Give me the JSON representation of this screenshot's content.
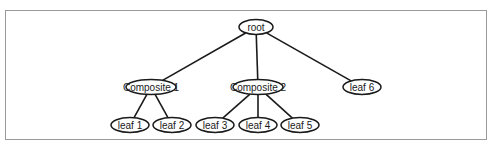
{
  "diagram": {
    "type": "tree",
    "colors": {
      "frame": "#9a9a9a",
      "node_stroke": "#1a1a1a",
      "node_fill": "#ffffff",
      "edge": "#1a1a1a",
      "text": "#1a1a1a"
    },
    "nodes": [
      {
        "id": "root",
        "label": "root",
        "cx": 256,
        "cy": 27,
        "rx": 17,
        "ry": 7.5
      },
      {
        "id": "composite1",
        "label": "Composite 1",
        "cx": 151,
        "cy": 87,
        "rx": 25,
        "ry": 7.5
      },
      {
        "id": "composite2",
        "label": "Composite 2",
        "cx": 258,
        "cy": 87,
        "rx": 25,
        "ry": 7.5
      },
      {
        "id": "leaf6",
        "label": "leaf 6",
        "cx": 362,
        "cy": 87,
        "rx": 19,
        "ry": 7.5
      },
      {
        "id": "leaf1",
        "label": "leaf 1",
        "cx": 130,
        "cy": 125,
        "rx": 19,
        "ry": 7.5
      },
      {
        "id": "leaf2",
        "label": "leaf 2",
        "cx": 172,
        "cy": 125,
        "rx": 19,
        "ry": 7.5
      },
      {
        "id": "leaf3",
        "label": "leaf 3",
        "cx": 215,
        "cy": 125,
        "rx": 19,
        "ry": 7.5
      },
      {
        "id": "leaf4",
        "label": "leaf 4",
        "cx": 258,
        "cy": 125,
        "rx": 19,
        "ry": 7.5
      },
      {
        "id": "leaf5",
        "label": "leaf 5",
        "cx": 300,
        "cy": 125,
        "rx": 19,
        "ry": 7.5
      }
    ],
    "edges": [
      {
        "from": "root",
        "to": "composite1"
      },
      {
        "from": "root",
        "to": "composite2"
      },
      {
        "from": "root",
        "to": "leaf6"
      },
      {
        "from": "composite1",
        "to": "leaf1"
      },
      {
        "from": "composite1",
        "to": "leaf2"
      },
      {
        "from": "composite2",
        "to": "leaf3"
      },
      {
        "from": "composite2",
        "to": "leaf4"
      },
      {
        "from": "composite2",
        "to": "leaf5"
      }
    ]
  }
}
